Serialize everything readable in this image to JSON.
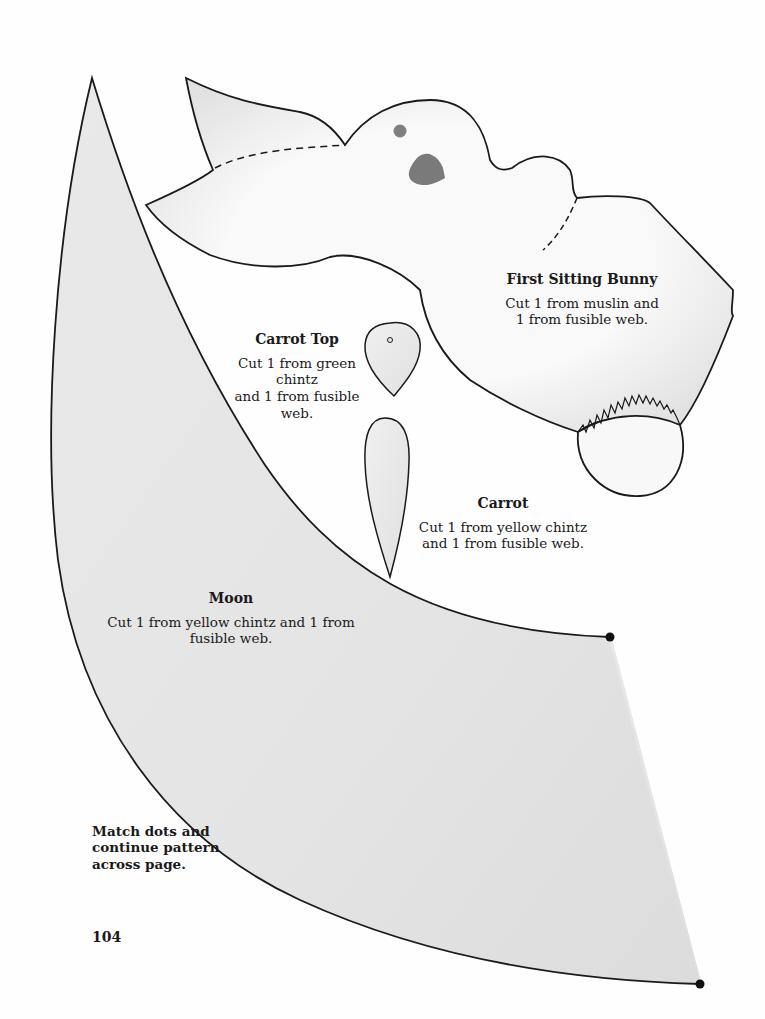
{
  "pieces": {
    "bunny": {
      "title": "First Sitting Bunny",
      "instructions": "Cut 1 from muslin and\n1 from fusible web."
    },
    "carrot_top": {
      "title": "Carrot Top",
      "instructions": "Cut 1 from green chintz\nand 1 from fusible web."
    },
    "carrot": {
      "title": "Carrot",
      "instructions": "Cut 1 from yellow chintz\nand 1 from fusible web."
    },
    "moon": {
      "title": "Moon",
      "instructions": "Cut 1 from yellow chintz and 1 from\nfusible web."
    }
  },
  "note": "Match dots and\ncontinue pattern\nacross page.",
  "page_number": "104",
  "colors": {
    "outline": "#1a1a1a",
    "moon_fill": "#e6e6e6",
    "piece_fill": "#f3f3f3",
    "bunny_fill": "#f7f7f7",
    "feature_gray": "#7a7a7a",
    "shading": "#d4d4d4"
  }
}
